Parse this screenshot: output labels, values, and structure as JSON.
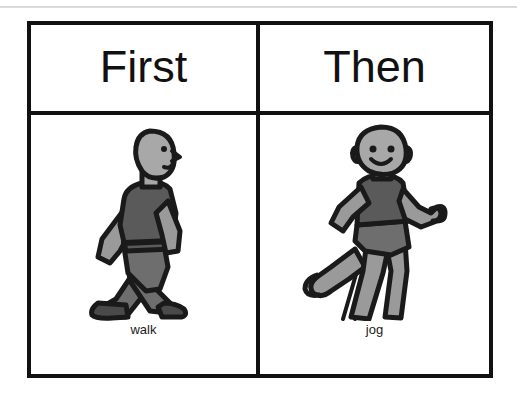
{
  "card": {
    "type": "first-then-visual-schedule",
    "columns": [
      {
        "header": "First",
        "item_label": "walk",
        "pictogram": "walking-person-icon"
      },
      {
        "header": "Then",
        "item_label": "jog",
        "pictogram": "jogging-person-icon"
      }
    ]
  },
  "colors": {
    "border": "#111111",
    "background": "#ffffff",
    "text": "#111111",
    "outline": "#1a1a1a",
    "skin": "#a8a8a8",
    "shirt": "#5a5a5a",
    "pants": "#6e6e6e",
    "shoes": "#4a4a4a",
    "top_rule": "#d9d9d9"
  }
}
